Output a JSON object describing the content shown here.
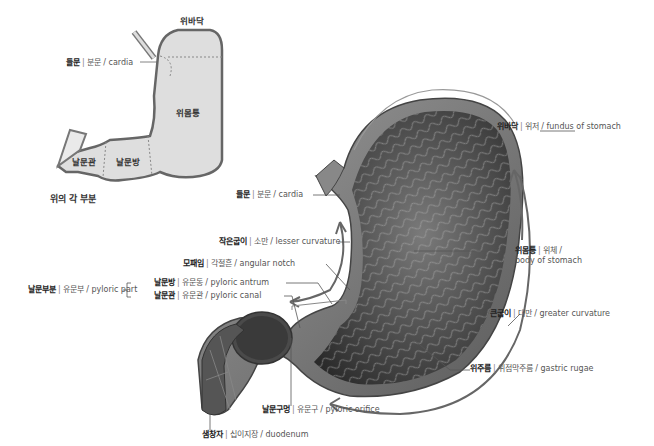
{
  "schematic": {
    "caption": "위의 각 부분",
    "regions": {
      "fundus": "위바닥",
      "body": "위몸통",
      "antrum": "날문방",
      "canal": "날문관"
    },
    "cardia_label": {
      "ko": "들문",
      "alt": "분문",
      "en": "cardia"
    }
  },
  "illustration": {
    "labels": {
      "fundus": {
        "ko": "위바닥",
        "alt": "위저",
        "en": "fundus of stomach"
      },
      "cardia": {
        "ko": "들문",
        "alt": "분문",
        "en": "cardia"
      },
      "lesser_curvature": {
        "ko": "작은굽이",
        "alt": "소만",
        "en": "lesser curvature"
      },
      "angular_notch": {
        "ko": "모패임",
        "alt": "각절흔",
        "en": "angular notch"
      },
      "pyloric_part": {
        "ko": "날문부분",
        "alt": "유문부",
        "en": "pyloric part"
      },
      "pyloric_antrum": {
        "ko": "날문방",
        "alt": "유문동",
        "en": "pyloric antrum"
      },
      "pyloric_canal": {
        "ko": "날문관",
        "alt": "유문관",
        "en": "pyloric canal"
      },
      "body": {
        "ko": "위몸통",
        "alt": "위체 /",
        "en": "body of stomach"
      },
      "greater_curvature": {
        "ko": "큰굽이",
        "alt": "대만",
        "en": "greater curvature"
      },
      "rugae": {
        "ko": "위주름",
        "alt": "위점막주름",
        "en": "gastric rugae"
      },
      "pyloric_orifice": {
        "ko": "날문구멍",
        "alt": "유문구",
        "en": "pyloric orifice"
      },
      "duodenum": {
        "ko": "샘창자",
        "alt": "십이지장",
        "en": "duodenum"
      }
    }
  }
}
